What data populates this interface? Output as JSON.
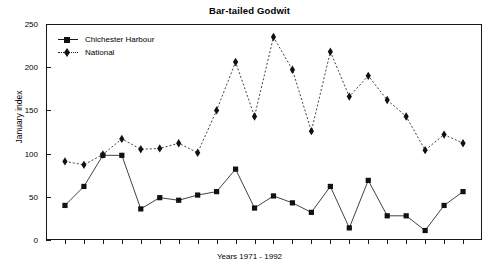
{
  "chart_data": {
    "type": "line",
    "title": "Bar-tailed Godwit",
    "xlabel": "Years 1971 - 1992",
    "ylabel": "January index",
    "grid": false,
    "legend_position": "top-left",
    "ylim": [
      0,
      250
    ],
    "yticks": [
      0,
      50,
      100,
      150,
      200,
      250
    ],
    "ytick_labels": [
      "0",
      "50",
      "100",
      "150",
      "200",
      "250"
    ],
    "x": [
      1971,
      1972,
      1973,
      1974,
      1975,
      1976,
      1977,
      1978,
      1979,
      1980,
      1981,
      1982,
      1983,
      1984,
      1985,
      1986,
      1987,
      1988,
      1989,
      1990,
      1991,
      1992
    ],
    "categories": [
      "1971",
      "1972",
      "1973",
      "1974",
      "1975",
      "1976",
      "1977",
      "1978",
      "1979",
      "1980",
      "1981",
      "1982",
      "1983",
      "1984",
      "1985",
      "1986",
      "1987",
      "1988",
      "1989",
      "1990",
      "1991",
      "1992"
    ],
    "series": [
      {
        "name": "Chichester Harbour",
        "marker": "square",
        "linestyle": "solid",
        "color": "#111111",
        "values": [
          40,
          62,
          98,
          98,
          36,
          49,
          46,
          52,
          56,
          82,
          37,
          51,
          43,
          32,
          62,
          14,
          69,
          28,
          28,
          11,
          40,
          56
        ]
      },
      {
        "name": "National",
        "marker": "diamond",
        "linestyle": "dotted",
        "color": "#111111",
        "values": [
          91,
          87,
          99,
          117,
          105,
          106,
          112,
          101,
          150,
          206,
          143,
          235,
          197,
          126,
          218,
          166,
          190,
          162,
          143,
          104,
          122,
          112
        ]
      }
    ]
  },
  "legend": {
    "items": [
      {
        "label": "Chichester Harbour"
      },
      {
        "label": "National"
      }
    ]
  }
}
